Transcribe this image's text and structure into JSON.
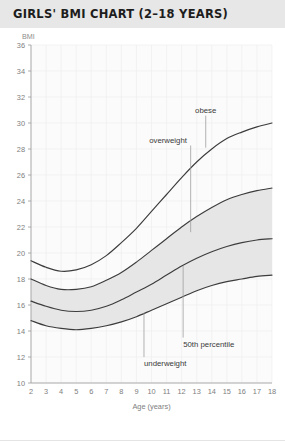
{
  "header": {
    "title": "GIRLS' BMI CHART (2–18 YEARS)",
    "background": "#e7e7e7",
    "text_color": "#1d1d1d"
  },
  "colors": {
    "curve": "#3c3c3c",
    "band": "#e6e6e6",
    "grid": "#ececec",
    "axis": "#9a9a9a",
    "tick_text": "#7e7e7e",
    "annotation_text": "#3a3a3a",
    "plot_background": "#fbfbfb"
  },
  "chart_data": {
    "type": "line",
    "title": "GIRLS' BMI CHART (2–18 YEARS)",
    "xlabel": "Age (years)",
    "ylabel": "BMI",
    "ylabel_position": "top-left",
    "xlim": [
      2,
      18
    ],
    "ylim": [
      10,
      36
    ],
    "grid": true,
    "legend": "none",
    "y_ticks": [
      10,
      12,
      14,
      16,
      18,
      20,
      22,
      24,
      26,
      28,
      30,
      32,
      34,
      36
    ],
    "x_ticks": [
      2,
      3,
      4,
      5,
      6,
      7,
      8,
      9,
      10,
      11,
      12,
      13,
      14,
      15,
      16,
      17,
      18
    ],
    "x": [
      2,
      3,
      4,
      5,
      6,
      7,
      8,
      9,
      10,
      11,
      12,
      13,
      14,
      15,
      16,
      17,
      18
    ],
    "series": [
      {
        "name": "obese",
        "label": "obese",
        "values": [
          19.4,
          18.9,
          18.6,
          18.7,
          19.1,
          19.8,
          20.8,
          21.9,
          23.2,
          24.5,
          25.8,
          27.0,
          28.0,
          28.8,
          29.3,
          29.7,
          30.0
        ]
      },
      {
        "name": "overweight",
        "label": "overweight",
        "values": [
          18.0,
          17.5,
          17.2,
          17.2,
          17.4,
          17.9,
          18.5,
          19.3,
          20.2,
          21.1,
          22.0,
          22.8,
          23.5,
          24.1,
          24.5,
          24.8,
          25.0
        ]
      },
      {
        "name": "50th-percentile",
        "label": "50th percentile",
        "values": [
          16.3,
          15.9,
          15.6,
          15.5,
          15.6,
          15.9,
          16.4,
          17.0,
          17.6,
          18.3,
          19.0,
          19.6,
          20.1,
          20.5,
          20.8,
          21.0,
          21.1
        ]
      },
      {
        "name": "underweight",
        "label": "underweight",
        "values": [
          14.8,
          14.4,
          14.2,
          14.1,
          14.2,
          14.4,
          14.7,
          15.1,
          15.6,
          16.1,
          16.6,
          17.1,
          17.5,
          17.8,
          18.0,
          18.2,
          18.3
        ]
      }
    ],
    "bands": [
      {
        "name": "overweight-band",
        "upper": "overweight",
        "lower": "50th-percentile"
      },
      {
        "name": "underweight-band",
        "upper": "50th-percentile",
        "lower": "underweight"
      }
    ],
    "annotations": [
      {
        "name": "obese",
        "text": "obese",
        "anchor_x": 13.6,
        "anchor_y": 30.8,
        "target_x": 13.6,
        "target_y": 28.1
      },
      {
        "name": "overweight",
        "text": "overweight",
        "anchor_x": 11.1,
        "anchor_y": 28.5,
        "target_x": 12.6,
        "target_y": 21.6
      },
      {
        "name": "50th-percentile",
        "text": "50th percentile",
        "anchor_x": 12.1,
        "anchor_y": 12.8,
        "target_x": 12.1,
        "target_y": 19.0
      },
      {
        "name": "underweight",
        "text": "underweight",
        "anchor_x": 9.5,
        "anchor_y": 11.3,
        "target_x": 9.5,
        "target_y": 15.4
      }
    ]
  }
}
